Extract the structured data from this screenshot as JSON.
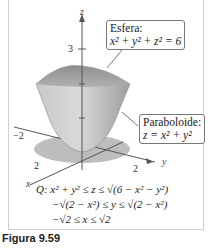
{
  "figure": {
    "caption": "Figura 9.59",
    "axes": {
      "z_label": "z",
      "x_label": "x",
      "y_label": "y",
      "ticks": {
        "z": "3",
        "x": "2",
        "y": "2",
        "neg_x": "−2"
      }
    },
    "callouts": {
      "sphere": {
        "title": "Esfera:",
        "equation": "x² + y² + z² = 6"
      },
      "paraboloid": {
        "title": "Paraboloide:",
        "equation": "z = x² + y²"
      }
    },
    "region": {
      "line1": "Q:  x² + y² ≤ z ≤ √(6 − x² − y²)",
      "line2": "−√(2 − x²) ≤ y ≤ √(2 − x²)",
      "line3": "−√2 ≤ x ≤ √2"
    },
    "colors": {
      "solid": "#b9b9b9",
      "shadow": "#bdbdbd",
      "axis": "#555555"
    }
  }
}
